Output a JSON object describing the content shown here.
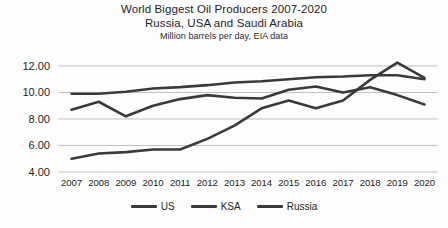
{
  "chart_data": {
    "type": "line",
    "title": "World Biggest Oil Producers 2007-2020",
    "subtitle": "Russia, USA and Saudi Arabia",
    "note": "Million barrels per day, EIA data",
    "xlabel": "",
    "ylabel": "",
    "categories": [
      "2007",
      "2008",
      "2009",
      "2010",
      "2011",
      "2012",
      "2013",
      "2014",
      "2015",
      "2016",
      "2017",
      "2018",
      "2019",
      "2020"
    ],
    "ylim": [
      4.0,
      12.6
    ],
    "yticks": [
      4.0,
      6.0,
      8.0,
      10.0,
      12.0
    ],
    "ytick_labels": [
      "4.00",
      "6.00",
      "8.00",
      "10.00",
      "12.00"
    ],
    "grid": true,
    "legend_position": "bottom",
    "series": [
      {
        "name": "US",
        "color": "#3a3a3a",
        "values": [
          5.0,
          5.4,
          5.5,
          5.7,
          5.7,
          6.5,
          7.5,
          8.8,
          9.4,
          8.8,
          9.4,
          10.95,
          12.25,
          11.1
        ]
      },
      {
        "name": "KSA",
        "color": "#3a3a3a",
        "values": [
          8.7,
          9.3,
          8.2,
          9.0,
          9.5,
          9.8,
          9.6,
          9.55,
          10.2,
          10.45,
          10.0,
          10.4,
          9.8,
          9.1
        ]
      },
      {
        "name": "Russia",
        "color": "#3a3a3a",
        "values": [
          9.9,
          9.9,
          10.05,
          10.3,
          10.4,
          10.55,
          10.75,
          10.85,
          11.0,
          11.15,
          11.2,
          11.3,
          11.3,
          11.0
        ]
      }
    ]
  },
  "legend": {
    "items": [
      {
        "label": "US"
      },
      {
        "label": "KSA"
      },
      {
        "label": "Russia"
      }
    ]
  }
}
